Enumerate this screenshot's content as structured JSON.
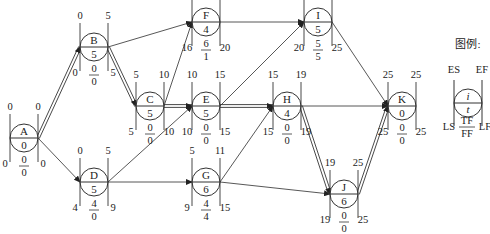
{
  "legend": {
    "title": "图例:",
    "es": "ES",
    "ef": "EF",
    "ls": "LS",
    "lf": "LF",
    "tf": "TF",
    "ff": "FF",
    "i": "i",
    "t": "t"
  },
  "nodes": [
    {
      "id": "A",
      "dur": "0",
      "es": "0",
      "ef": "0",
      "ls": "0",
      "lf": "0",
      "tf": "0",
      "ff": "0"
    },
    {
      "id": "B",
      "dur": "5",
      "es": "0",
      "ef": "5",
      "ls": "0",
      "lf": "5",
      "tf": "0",
      "ff": "0"
    },
    {
      "id": "C",
      "dur": "5",
      "es": "5",
      "ef": "10",
      "ls": "5",
      "lf": "10",
      "tf": "0",
      "ff": "0"
    },
    {
      "id": "D",
      "dur": "5",
      "es": "0",
      "ef": "5",
      "ls": "4",
      "lf": "9",
      "tf": "4",
      "ff": "0"
    },
    {
      "id": "E",
      "dur": "5",
      "es": "10",
      "ef": "15",
      "ls": "10",
      "lf": "15",
      "tf": "0",
      "ff": "0"
    },
    {
      "id": "F",
      "dur": "4",
      "es": "10",
      "ef": "14",
      "ls": "16",
      "lf": "20",
      "tf": "6",
      "ff": "1"
    },
    {
      "id": "G",
      "dur": "6",
      "es": "5",
      "ef": "11",
      "ls": "9",
      "lf": "15",
      "tf": "4",
      "ff": "4"
    },
    {
      "id": "H",
      "dur": "4",
      "es": "15",
      "ef": "19",
      "ls": "15",
      "lf": "19",
      "tf": "0",
      "ff": "0"
    },
    {
      "id": "I",
      "dur": "5",
      "es": "15",
      "ef": "20",
      "ls": "20",
      "lf": "25",
      "tf": "5",
      "ff": "5"
    },
    {
      "id": "J",
      "dur": "6",
      "es": "19",
      "ef": "25",
      "ls": "19",
      "lf": "25",
      "tf": "0",
      "ff": "0"
    },
    {
      "id": "K",
      "dur": "0",
      "es": "25",
      "ef": "25",
      "ls": "25",
      "lf": "25",
      "tf": "0",
      "ff": "0"
    }
  ],
  "edges": [
    {
      "from": "A",
      "to": "B",
      "critical": true
    },
    {
      "from": "A",
      "to": "D",
      "critical": false
    },
    {
      "from": "B",
      "to": "C",
      "critical": true
    },
    {
      "from": "B",
      "to": "F",
      "critical": false
    },
    {
      "from": "C",
      "to": "F",
      "critical": false
    },
    {
      "from": "C",
      "to": "E",
      "critical": true
    },
    {
      "from": "D",
      "to": "E",
      "critical": false
    },
    {
      "from": "D",
      "to": "G",
      "critical": false
    },
    {
      "from": "E",
      "to": "I",
      "critical": false
    },
    {
      "from": "E",
      "to": "H",
      "critical": true
    },
    {
      "from": "F",
      "to": "I",
      "critical": false
    },
    {
      "from": "G",
      "to": "H",
      "critical": false
    },
    {
      "from": "G",
      "to": "J",
      "critical": false
    },
    {
      "from": "H",
      "to": "K",
      "critical": false
    },
    {
      "from": "H",
      "to": "J",
      "critical": true
    },
    {
      "from": "I",
      "to": "K",
      "critical": false
    },
    {
      "from": "J",
      "to": "K",
      "critical": true
    }
  ]
}
